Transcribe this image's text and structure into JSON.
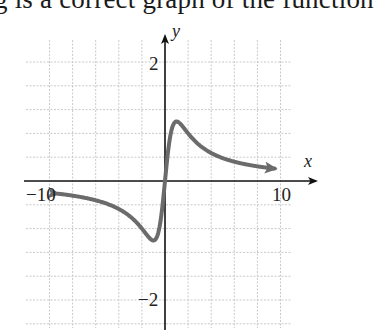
{
  "caption": "g is a correct graph of the function",
  "chart_data": {
    "type": "line",
    "title": "",
    "xlabel": "x",
    "ylabel": "y",
    "xlim": [
      -12,
      12.8
    ],
    "ylim": [
      -2.5,
      2.4
    ],
    "x_ticks_labeled": [
      "-10",
      "10"
    ],
    "y_ticks_labeled": [
      "2",
      "-2"
    ],
    "grid": true,
    "grid_step_x": 2,
    "grid_step_y": 0.4,
    "series": [
      {
        "name": "f(x)",
        "color": "#6b6b6b",
        "function_hint": "y = 2x/(x^2+1)",
        "x": [
          -9.3,
          -8,
          -6,
          -4,
          -3,
          -2,
          -1.5,
          -1,
          -0.6,
          -0.3,
          0,
          0.3,
          0.6,
          1,
          1.5,
          2,
          3,
          4,
          6,
          8,
          9.5
        ],
        "y": [
          -0.21,
          -0.25,
          -0.32,
          -0.47,
          -0.6,
          -0.8,
          -0.92,
          -1.0,
          -0.88,
          -0.55,
          0,
          0.55,
          0.88,
          1.0,
          0.92,
          0.8,
          0.6,
          0.47,
          0.32,
          0.25,
          0.21
        ],
        "arrows_both_ends": true
      }
    ],
    "extrema": {
      "max": [
        1,
        1
      ],
      "min": [
        -1,
        -1
      ]
    }
  },
  "labels": {
    "x_axis": "x",
    "y_axis": "y",
    "x_min": "−10",
    "x_max": "10",
    "y_max": "2",
    "y_min": "−2"
  }
}
